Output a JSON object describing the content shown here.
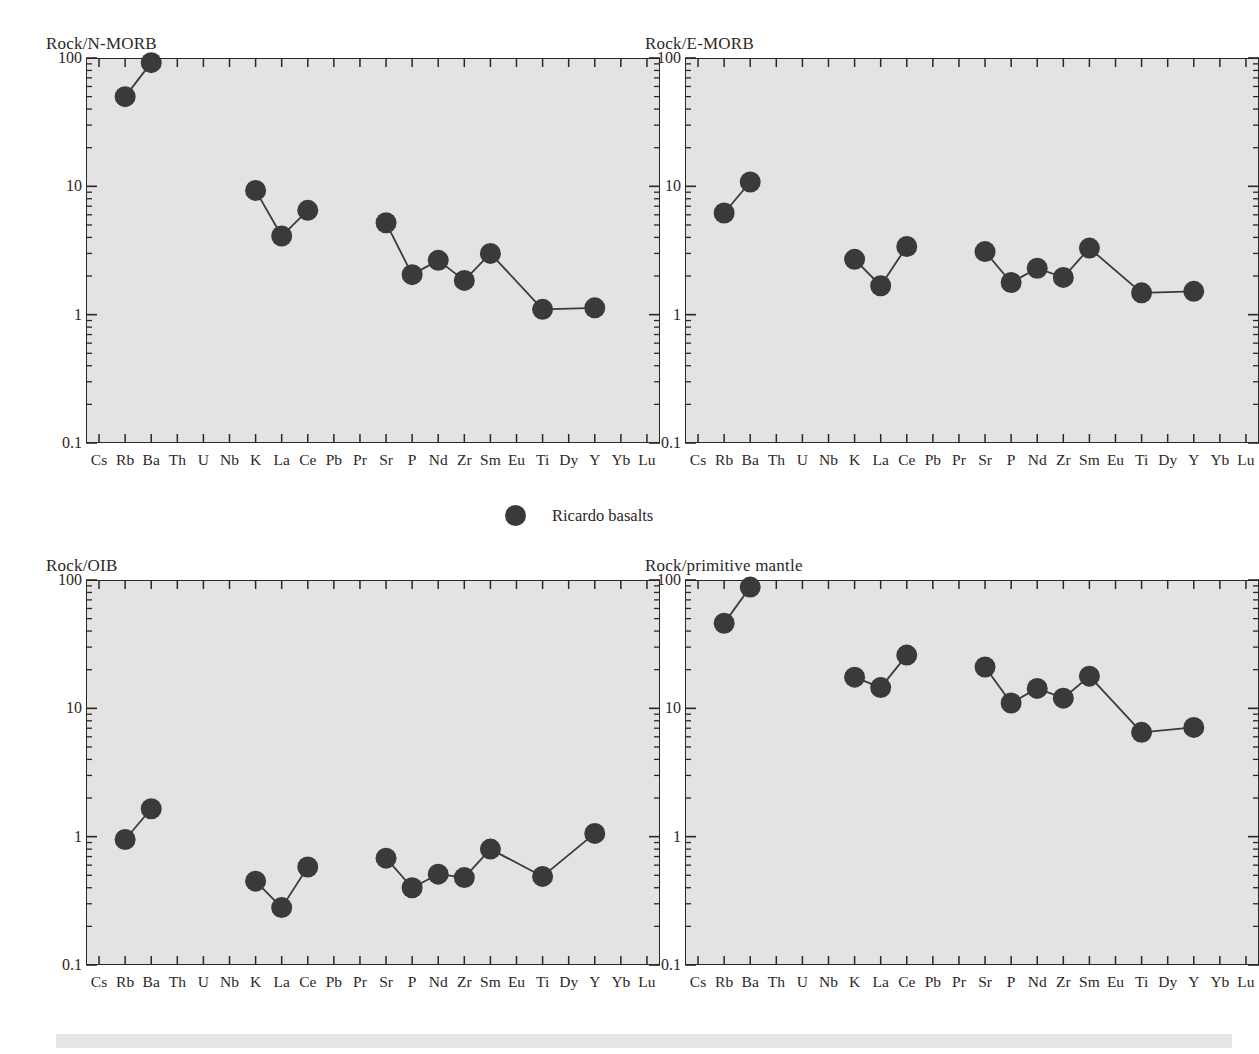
{
  "figure": {
    "legend": {
      "label": "Ricardo basalts",
      "marker": "filled-circle",
      "marker_color": "#3b3a39"
    },
    "axis": {
      "elements": [
        "Cs",
        "Rb",
        "Ba",
        "Th",
        "U",
        "Nb",
        "K",
        "La",
        "Ce",
        "Pb",
        "Pr",
        "Sr",
        "P",
        "Nd",
        "Zr",
        "Sm",
        "Eu",
        "Ti",
        "Dy",
        "Y",
        "Yb",
        "Lu"
      ],
      "y_ticks": [
        "100",
        "10",
        "1",
        "0.1"
      ],
      "y_min": 0.1,
      "y_max": 100,
      "scale": "log"
    },
    "colors": {
      "plot_background": "#e3e3e3",
      "axis": "#2a2726",
      "marker": "#3b3a39",
      "text": "#2b2726",
      "bottom_band": "#e6e6e6"
    }
  },
  "chart_data": [
    {
      "type": "line",
      "id": "rock-n-morb",
      "title": "Rock/N-MORB",
      "xlabel": "",
      "ylabel": "",
      "scale": "log",
      "ylim": [
        0.1,
        100
      ],
      "ytick_labels": [
        "100",
        "10",
        "1",
        "0.1"
      ],
      "categories": [
        "Cs",
        "Rb",
        "Ba",
        "Th",
        "U",
        "Nb",
        "K",
        "La",
        "Ce",
        "Pb",
        "Pr",
        "Sr",
        "P",
        "Nd",
        "Zr",
        "Sm",
        "Eu",
        "Ti",
        "Dy",
        "Y",
        "Yb",
        "Lu"
      ],
      "series": [
        {
          "name": "Ricardo basalts",
          "points": [
            {
              "x": "Rb",
              "y": 50
            },
            {
              "x": "Ba",
              "y": 92
            },
            {
              "x": "K",
              "y": 9.3
            },
            {
              "x": "La",
              "y": 4.1
            },
            {
              "x": "Ce",
              "y": 6.5
            },
            {
              "x": "Sr",
              "y": 5.2
            },
            {
              "x": "P",
              "y": 2.05
            },
            {
              "x": "Nd",
              "y": 2.65
            },
            {
              "x": "Zr",
              "y": 1.85
            },
            {
              "x": "Sm",
              "y": 3.0
            },
            {
              "x": "Ti",
              "y": 1.1
            },
            {
              "x": "Y",
              "y": 1.13
            }
          ],
          "breaks": [
            [
              "Ba",
              "K"
            ],
            [
              "Ce",
              "Sr"
            ]
          ]
        }
      ]
    },
    {
      "type": "line",
      "id": "rock-e-morb",
      "title": "Rock/E-MORB",
      "xlabel": "",
      "ylabel": "",
      "scale": "log",
      "ylim": [
        0.1,
        100
      ],
      "ytick_labels": [
        "100",
        "10",
        "1",
        "0.1"
      ],
      "categories": [
        "Cs",
        "Rb",
        "Ba",
        "Th",
        "U",
        "Nb",
        "K",
        "La",
        "Ce",
        "Pb",
        "Pr",
        "Sr",
        "P",
        "Nd",
        "Zr",
        "Sm",
        "Eu",
        "Ti",
        "Dy",
        "Y",
        "Yb",
        "Lu"
      ],
      "series": [
        {
          "name": "Ricardo basalts",
          "points": [
            {
              "x": "Rb",
              "y": 6.2
            },
            {
              "x": "Ba",
              "y": 10.8
            },
            {
              "x": "K",
              "y": 2.7
            },
            {
              "x": "La",
              "y": 1.68
            },
            {
              "x": "Ce",
              "y": 3.4
            },
            {
              "x": "Sr",
              "y": 3.1
            },
            {
              "x": "P",
              "y": 1.78
            },
            {
              "x": "Nd",
              "y": 2.3
            },
            {
              "x": "Zr",
              "y": 1.95
            },
            {
              "x": "Sm",
              "y": 3.3
            },
            {
              "x": "Ti",
              "y": 1.48
            },
            {
              "x": "Y",
              "y": 1.52
            }
          ],
          "breaks": [
            [
              "Ba",
              "K"
            ],
            [
              "Ce",
              "Sr"
            ]
          ]
        }
      ]
    },
    {
      "type": "line",
      "id": "rock-oib",
      "title": "Rock/OIB",
      "xlabel": "",
      "ylabel": "",
      "scale": "log",
      "ylim": [
        0.1,
        100
      ],
      "ytick_labels": [
        "100",
        "10",
        "1",
        "0.1"
      ],
      "categories": [
        "Cs",
        "Rb",
        "Ba",
        "Th",
        "U",
        "Nb",
        "K",
        "La",
        "Ce",
        "Pb",
        "Pr",
        "Sr",
        "P",
        "Nd",
        "Zr",
        "Sm",
        "Eu",
        "Ti",
        "Dy",
        "Y",
        "Yb",
        "Lu"
      ],
      "series": [
        {
          "name": "Ricardo basalts",
          "points": [
            {
              "x": "Rb",
              "y": 0.95
            },
            {
              "x": "Ba",
              "y": 1.65
            },
            {
              "x": "K",
              "y": 0.45
            },
            {
              "x": "La",
              "y": 0.28
            },
            {
              "x": "Ce",
              "y": 0.58
            },
            {
              "x": "Sr",
              "y": 0.68
            },
            {
              "x": "P",
              "y": 0.4
            },
            {
              "x": "Nd",
              "y": 0.51
            },
            {
              "x": "Zr",
              "y": 0.48
            },
            {
              "x": "Sm",
              "y": 0.8
            },
            {
              "x": "Ti",
              "y": 0.49
            },
            {
              "x": "Y",
              "y": 1.06
            }
          ],
          "breaks": [
            [
              "Ba",
              "K"
            ],
            [
              "Ce",
              "Sr"
            ]
          ]
        }
      ]
    },
    {
      "type": "line",
      "id": "rock-primitive-mantle",
      "title": "Rock/primitive mantle",
      "xlabel": "",
      "ylabel": "",
      "scale": "log",
      "ylim": [
        0.1,
        100
      ],
      "ytick_labels": [
        "100",
        "10",
        "1",
        "0.1"
      ],
      "categories": [
        "Cs",
        "Rb",
        "Ba",
        "Th",
        "U",
        "Nb",
        "K",
        "La",
        "Ce",
        "Pb",
        "Pr",
        "Sr",
        "P",
        "Nd",
        "Zr",
        "Sm",
        "Eu",
        "Ti",
        "Dy",
        "Y",
        "Yb",
        "Lu"
      ],
      "series": [
        {
          "name": "Ricardo basalts",
          "points": [
            {
              "x": "Rb",
              "y": 46
            },
            {
              "x": "Ba",
              "y": 88
            },
            {
              "x": "K",
              "y": 17.5
            },
            {
              "x": "La",
              "y": 14.5
            },
            {
              "x": "Ce",
              "y": 26
            },
            {
              "x": "Sr",
              "y": 21
            },
            {
              "x": "P",
              "y": 11
            },
            {
              "x": "Nd",
              "y": 14.3
            },
            {
              "x": "Zr",
              "y": 12
            },
            {
              "x": "Sm",
              "y": 17.8
            },
            {
              "x": "Ti",
              "y": 6.5
            },
            {
              "x": "Y",
              "y": 7.1
            }
          ],
          "breaks": [
            [
              "Ba",
              "K"
            ],
            [
              "Ce",
              "Sr"
            ]
          ]
        }
      ]
    }
  ]
}
